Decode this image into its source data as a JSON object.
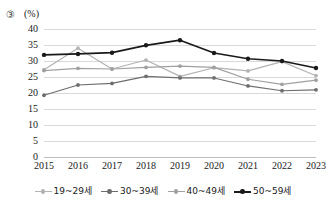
{
  "figure": {
    "marker": "③",
    "unit_label": "(%)"
  },
  "chart_data": {
    "type": "line",
    "title": "",
    "xlabel": "",
    "ylabel": "(%)",
    "ylim": [
      0,
      40
    ],
    "yticks": [
      0,
      5,
      10,
      15,
      20,
      25,
      30,
      35,
      40
    ],
    "grid": true,
    "legend_position": "bottom",
    "categories": [
      "2015",
      "2016",
      "2017",
      "2018",
      "2019",
      "2020",
      "2021",
      "2022",
      "2023"
    ],
    "series": [
      {
        "name": "19~29세",
        "color": "#b3b3b3",
        "values": [
          27.3,
          34.0,
          27.5,
          30.3,
          25.2,
          27.9,
          26.9,
          29.8,
          25.4
        ]
      },
      {
        "name": "30~39세",
        "color": "#6e6e6e",
        "values": [
          19.3,
          22.5,
          23.0,
          25.2,
          24.7,
          24.7,
          22.2,
          20.7,
          21.0
        ]
      },
      {
        "name": "40~49세",
        "color": "#a0a0a0",
        "values": [
          27.0,
          27.7,
          27.5,
          28.0,
          28.4,
          28.0,
          24.3,
          22.7,
          24.0
        ]
      },
      {
        "name": "50~59세",
        "color": "#1a1a1a",
        "values": [
          31.9,
          32.2,
          32.6,
          34.9,
          36.5,
          32.5,
          30.7,
          30.0,
          27.8
        ]
      }
    ]
  }
}
